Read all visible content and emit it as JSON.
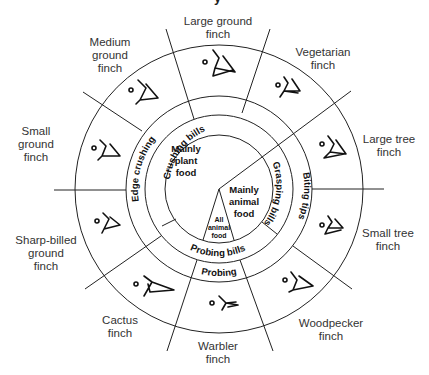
{
  "diagram": {
    "title_fragment": "y",
    "center": {
      "plant": [
        "Mainly",
        "plant",
        "food"
      ],
      "animal": [
        "Mainly",
        "animal",
        "food"
      ],
      "all_animal": [
        "All",
        "animal",
        "food"
      ]
    },
    "bill_ring": {
      "crushing": "Crushing bills",
      "grasping": "Grasping bills",
      "probing": "Probing bills"
    },
    "use_ring": {
      "edge_crushing": "Edge crushing",
      "biting_tips": "Biting tips",
      "probing": "Probing"
    },
    "finches": [
      {
        "line1": "Large ground",
        "line2": "finch",
        "icon": "finch-beak-icon"
      },
      {
        "line1": "Vegetarian",
        "line2": "finch",
        "icon": "finch-beak-icon"
      },
      {
        "line1": "Large tree",
        "line2": "finch",
        "icon": "finch-beak-icon"
      },
      {
        "line1": "Small tree",
        "line2": "finch",
        "icon": "finch-beak-icon"
      },
      {
        "line1": "Woodpecker",
        "line2": "finch",
        "icon": "finch-beak-icon"
      },
      {
        "line1": "Warbler",
        "line2": "finch",
        "icon": "finch-beak-icon"
      },
      {
        "line1": "Cactus",
        "line2": "finch",
        "icon": "finch-beak-icon"
      },
      {
        "line1": "Sharp-billed",
        "line2": "ground",
        "line3": "finch",
        "icon": "finch-beak-icon"
      },
      {
        "line1": "Small",
        "line2": "ground",
        "line3": "finch",
        "icon": "finch-beak-icon"
      },
      {
        "line1": "Medium",
        "line2": "ground",
        "line3": "finch",
        "icon": "finch-beak-icon"
      }
    ]
  }
}
